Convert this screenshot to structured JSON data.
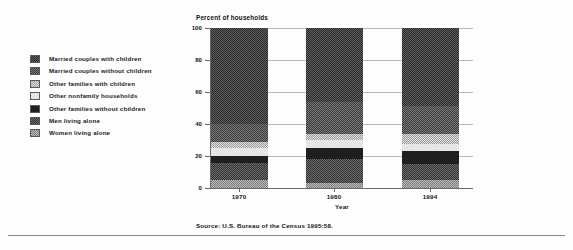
{
  "chart_data": {
    "type": "bar",
    "subtype": "stacked-vertical-percent",
    "title": "Percent of households",
    "xlabel": "Year",
    "ylabel": "Percent of households",
    "categories": [
      "1970",
      "1980",
      "1994"
    ],
    "ylim": [
      0,
      100
    ],
    "ytick_labels": [
      "0",
      "20",
      "40",
      "60",
      "80",
      "100"
    ],
    "ytick_values": [
      0,
      20,
      40,
      60,
      80,
      100
    ],
    "grid": true,
    "legend_position": "left-outside",
    "source": "Source: U.S. Bureau of the Census 1995:58.",
    "series": [
      {
        "name": "Married couples with children",
        "swatch": "p-mwc",
        "color": "#3d3d3d",
        "values": [
          60.0,
          46.0,
          49.0
        ]
      },
      {
        "name": "Married couples without children",
        "swatch": "p-mwoc",
        "color": "#545454",
        "values": [
          11.0,
          20.0,
          17.0
        ]
      },
      {
        "name": "Other families with children",
        "swatch": "p-ofwc",
        "color": "#b5b5b5",
        "values": [
          4.0,
          4.0,
          6.5
        ]
      },
      {
        "name": "Other nonfamily households",
        "swatch": "p-onf",
        "color": "#e6e6e6",
        "values": [
          5.0,
          5.0,
          4.5
        ]
      },
      {
        "name": "Other families without children",
        "swatch": "p-ofwoc",
        "color": "#1f1f1f",
        "values": [
          4.5,
          7.0,
          8.0
        ]
      },
      {
        "name": "Men living alone",
        "swatch": "p-men",
        "color": "#4a4a4a",
        "values": [
          10.5,
          15.0,
          10.0
        ]
      },
      {
        "name": "Women living alone",
        "swatch": "p-women",
        "color": "#9c9c9c",
        "values": [
          5.0,
          3.0,
          5.0
        ]
      }
    ],
    "stack_order_bottom_to_top": [
      "Women living alone",
      "Men living alone",
      "Other families without children",
      "Other nonfamily households",
      "Other families with children",
      "Married couples without children",
      "Married couples with children"
    ]
  },
  "legend": {
    "items": [
      {
        "label": "Married couples with children",
        "swatch": "p-mwc"
      },
      {
        "label": "Married couples without children",
        "swatch": "p-mwoc"
      },
      {
        "label": "Other families with children",
        "swatch": "p-ofwc"
      },
      {
        "label": "Other nonfamily households",
        "swatch": "p-onf"
      },
      {
        "label": "Other families without children",
        "swatch": "p-ofwoc"
      },
      {
        "label": "Men living alone",
        "swatch": "p-men"
      },
      {
        "label": "Women living alone",
        "swatch": "p-women"
      }
    ]
  }
}
